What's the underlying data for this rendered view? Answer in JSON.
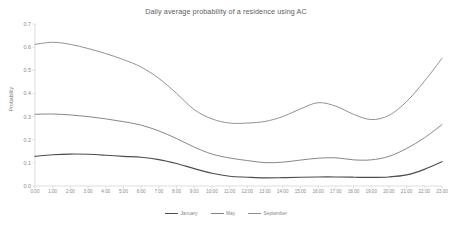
{
  "chart_data": {
    "type": "line",
    "title": "Daily average probability of a residence using AC",
    "xlabel": "Time",
    "ylabel": "Probability",
    "grid": false,
    "legend_position": "bottom-center",
    "ylim": [
      0.0,
      0.7
    ],
    "ytick_labels": [
      "0.0",
      "0.1",
      "0.2",
      "0.3",
      "0.4",
      "0.5",
      "0.6",
      "0.7"
    ],
    "ytick_values": [
      0.0,
      0.1,
      0.2,
      0.3,
      0.4,
      0.5,
      0.6,
      0.7
    ],
    "categories": [
      "0:00",
      "1:00",
      "2:00",
      "3:00",
      "4:00",
      "5:00",
      "6:00",
      "7:00",
      "8:00",
      "9:00",
      "10:00",
      "11:00",
      "12:00",
      "13:00",
      "14:00",
      "15:00",
      "16:00",
      "17:00",
      "18:00",
      "19:00",
      "20:00",
      "21:00",
      "22:00",
      "23:00"
    ],
    "series": [
      {
        "name": "January",
        "color": "#4d4d4d",
        "values": [
          0.128,
          0.135,
          0.138,
          0.137,
          0.133,
          0.128,
          0.124,
          0.114,
          0.097,
          0.075,
          0.055,
          0.042,
          0.038,
          0.035,
          0.036,
          0.038,
          0.039,
          0.039,
          0.038,
          0.037,
          0.039,
          0.048,
          0.072,
          0.105
        ]
      },
      {
        "name": "May",
        "color": "#7f7f7f",
        "values": [
          0.31,
          0.311,
          0.307,
          0.3,
          0.29,
          0.278,
          0.263,
          0.238,
          0.205,
          0.168,
          0.138,
          0.121,
          0.11,
          0.101,
          0.103,
          0.112,
          0.12,
          0.122,
          0.113,
          0.113,
          0.128,
          0.162,
          0.208,
          0.265
        ]
      },
      {
        "name": "September",
        "color": "#8c8c8c",
        "values": [
          0.612,
          0.621,
          0.612,
          0.594,
          0.572,
          0.546,
          0.514,
          0.465,
          0.4,
          0.33,
          0.29,
          0.272,
          0.272,
          0.279,
          0.3,
          0.333,
          0.36,
          0.345,
          0.31,
          0.287,
          0.305,
          0.365,
          0.452,
          0.552
        ]
      }
    ]
  }
}
